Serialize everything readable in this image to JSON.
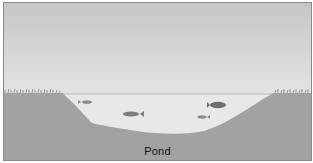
{
  "diagram": {
    "title": "Pond",
    "elements": {
      "sky": {
        "color_top": "#c6c6c6",
        "color_bottom": "#f2f2f2"
      },
      "ground": {
        "color": "#a2a2a2"
      },
      "water": {
        "color": "#e8e8e8"
      },
      "grass": [
        "left-bank-grass",
        "right-bank-grass"
      ],
      "fish": [
        {
          "name": "small-fish-1",
          "x": 86,
          "y": 100,
          "size": "small"
        },
        {
          "name": "medium-fish",
          "x": 130,
          "y": 112,
          "size": "medium"
        },
        {
          "name": "large-fish",
          "x": 216,
          "y": 103,
          "size": "large"
        },
        {
          "name": "small-fish-2",
          "x": 201,
          "y": 115,
          "size": "small"
        }
      ]
    }
  }
}
